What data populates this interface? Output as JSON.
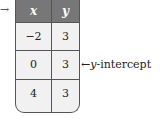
{
  "figure": {
    "type": "table",
    "pointer_arrow": "→",
    "headers": [
      "x",
      "y"
    ],
    "rows": [
      {
        "x": "−2",
        "y": "3"
      },
      {
        "x": "0",
        "y": "3"
      },
      {
        "x": "4",
        "y": "3"
      }
    ],
    "annotation": {
      "arrow": "←",
      "var": "y",
      "text": "-intercept",
      "row_index": 1
    },
    "colors": {
      "header_bg": "#777777",
      "cell_bg": "#f1f1f1",
      "border": "#555555"
    }
  }
}
